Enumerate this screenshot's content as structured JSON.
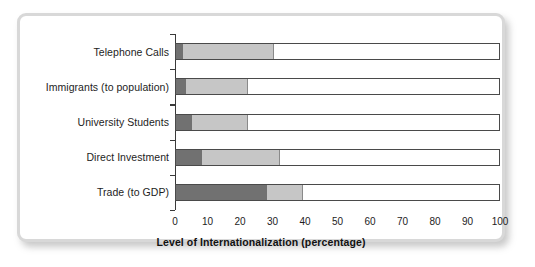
{
  "chart_data": {
    "type": "bar",
    "orientation": "horizontal",
    "stacked": true,
    "title": "",
    "xlabel": "Level of Internationalization (percentage)",
    "ylabel": "",
    "xlim": [
      0,
      100
    ],
    "xticks": [
      "0",
      "10",
      "20",
      "30",
      "40",
      "50",
      "60",
      "70",
      "80",
      "90",
      "100"
    ],
    "xtick_values": [
      0,
      10,
      20,
      30,
      40,
      50,
      60,
      70,
      80,
      90,
      100
    ],
    "grid": false,
    "legend": "none",
    "categories": [
      "Telephone Calls",
      "Immigrants (to population)",
      "University Students",
      "Direct Investment",
      "Trade (to GDP)"
    ],
    "series": [
      {
        "name": "dark segment",
        "color": "#717171",
        "values": [
          2,
          3,
          5,
          8,
          28
        ]
      },
      {
        "name": "light segment",
        "color": "#c6c6c6",
        "values": [
          28,
          19,
          17,
          24,
          11
        ]
      },
      {
        "name": "remainder",
        "color": "#ffffff",
        "values": [
          70,
          78,
          78,
          68,
          61
        ]
      }
    ],
    "cumulative_endpoints": [
      {
        "category": "Telephone Calls",
        "dark_end": 2,
        "light_end": 30,
        "total": 100
      },
      {
        "category": "Immigrants (to population)",
        "dark_end": 3,
        "light_end": 22,
        "total": 100
      },
      {
        "category": "University Students",
        "dark_end": 5,
        "light_end": 22,
        "total": 100
      },
      {
        "category": "Direct Investment",
        "dark_end": 8,
        "light_end": 32,
        "total": 100
      },
      {
        "category": "Trade (to GDP)",
        "dark_end": 28,
        "light_end": 39,
        "total": 100
      }
    ]
  },
  "frame": {
    "border_color": "#d8d8d8",
    "background": "#ffffff"
  }
}
